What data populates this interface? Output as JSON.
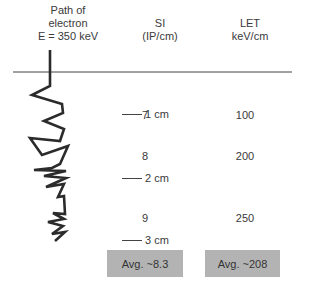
{
  "headers": {
    "path": [
      "Path of",
      "electron",
      "E = 350 keV"
    ],
    "si": [
      "SI",
      "(IP/cm)"
    ],
    "let": [
      "LET",
      "keV/cm"
    ]
  },
  "rows": [
    {
      "si": "7",
      "let": "100",
      "scale": "1 cm"
    },
    {
      "si": "8",
      "let": "200",
      "scale": "2 cm"
    },
    {
      "si": "9",
      "let": "250",
      "scale": "3 cm"
    }
  ],
  "averages": {
    "si": "Avg. ~8.3",
    "let": "Avg. ~208"
  },
  "colors": {
    "line": "#2b2b2b",
    "avg_box": "#b3b3b3"
  }
}
